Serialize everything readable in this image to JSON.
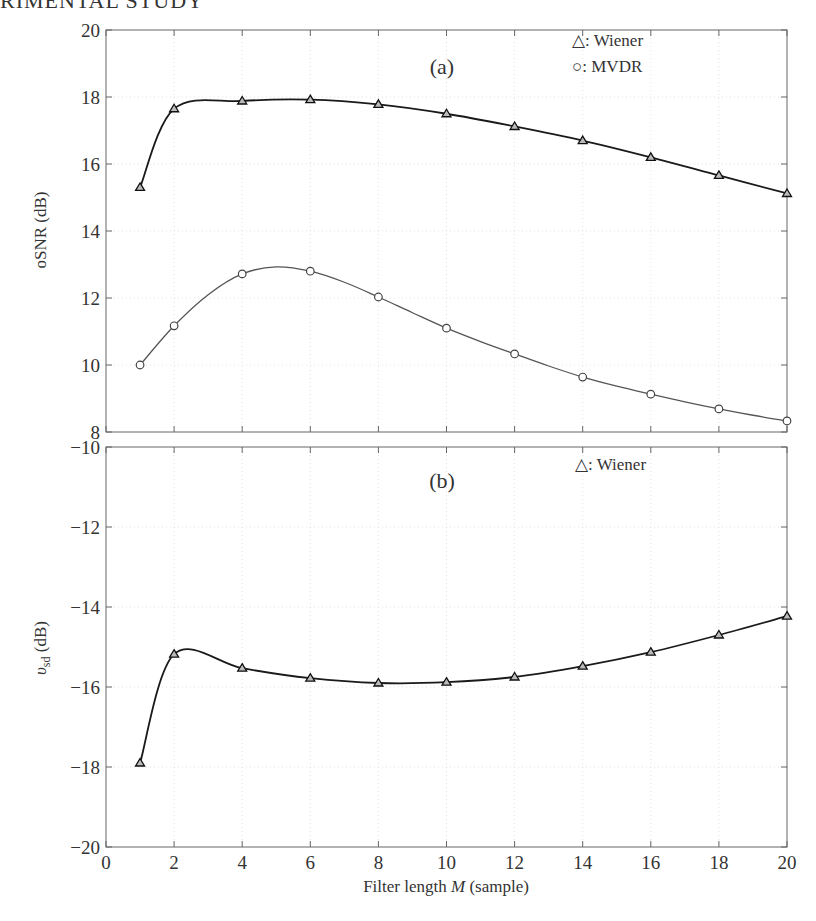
{
  "page": {
    "header_text": "RIMENTAL STUDY"
  },
  "chart_data": [
    {
      "type": "line",
      "panel_label": "(a)",
      "title": "",
      "xlabel": "Filter length M (sample)",
      "ylabel": "oSNR (dB)",
      "xlim": [
        0,
        20
      ],
      "ylim": [
        8,
        20
      ],
      "xticks": [
        0,
        2,
        4,
        6,
        8,
        10,
        12,
        14,
        16,
        18,
        20
      ],
      "yticks": [
        8,
        10,
        12,
        14,
        16,
        18,
        20
      ],
      "grid": true,
      "legend_position": "upper right",
      "x": [
        1,
        2,
        4,
        6,
        8,
        10,
        12,
        14,
        16,
        18,
        20
      ],
      "series": [
        {
          "name": "Wiener",
          "legend_label": "△: Wiener",
          "marker": "triangle",
          "color": "#1a1a1a",
          "values": [
            15.3,
            17.65,
            17.88,
            17.92,
            17.78,
            17.5,
            17.12,
            16.7,
            16.2,
            15.66,
            15.12
          ]
        },
        {
          "name": "MVDR",
          "legend_label": "○: MVDR",
          "marker": "circle",
          "color": "#555555",
          "values": [
            10.0,
            11.17,
            12.72,
            12.8,
            12.03,
            11.1,
            10.33,
            9.64,
            9.13,
            8.69,
            8.33
          ],
          "curve_points": [
            [
              1,
              10.0
            ],
            [
              2,
              11.17
            ],
            [
              3,
              12.1
            ],
            [
              4,
              12.72
            ],
            [
              5,
              12.93
            ],
            [
              6,
              12.8
            ],
            [
              7,
              12.47
            ],
            [
              8,
              12.03
            ],
            [
              9,
              11.56
            ],
            [
              10,
              11.1
            ],
            [
              11,
              10.7
            ],
            [
              12,
              10.33
            ],
            [
              13,
              9.97
            ],
            [
              14,
              9.64
            ],
            [
              15,
              9.37
            ],
            [
              16,
              9.13
            ],
            [
              17,
              8.9
            ],
            [
              18,
              8.69
            ],
            [
              19,
              8.5
            ],
            [
              20,
              8.33
            ]
          ]
        }
      ]
    },
    {
      "type": "line",
      "panel_label": "(b)",
      "title": "",
      "xlabel": "Filter length M (sample)",
      "ylabel": "υsd (dB)",
      "xlim": [
        0,
        20
      ],
      "ylim": [
        -20,
        -10
      ],
      "xticks": [
        0,
        2,
        4,
        6,
        8,
        10,
        12,
        14,
        16,
        18,
        20
      ],
      "yticks": [
        -20,
        -18,
        -16,
        -14,
        -12,
        -10
      ],
      "grid": true,
      "legend_position": "upper right",
      "x": [
        1,
        2,
        4,
        6,
        8,
        10,
        12,
        14,
        16,
        18,
        20
      ],
      "series": [
        {
          "name": "Wiener",
          "legend_label": "△: Wiener",
          "marker": "triangle",
          "color": "#1a1a1a",
          "values": [
            -17.9,
            -15.18,
            -15.53,
            -15.78,
            -15.9,
            -15.88,
            -15.75,
            -15.48,
            -15.13,
            -14.7,
            -14.23
          ]
        }
      ]
    }
  ],
  "labels": {
    "xlabel_prefix": "Filter length ",
    "xlabel_var": "M",
    "xlabel_suffix": " (sample)",
    "ylabel_a": "oSNR (dB)",
    "ylabel_b_var": "υ",
    "ylabel_b_sub": "sd",
    "ylabel_b_unit": " (dB)",
    "ytick_minus": "−"
  }
}
